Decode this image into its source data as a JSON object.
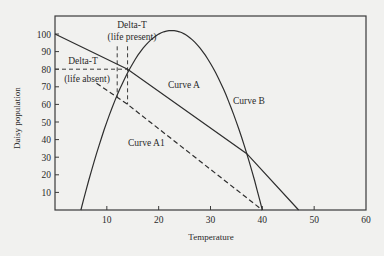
{
  "chart_data": {
    "type": "line",
    "title": "",
    "xlabel": "Temperature",
    "ylabel": "Daisy population",
    "xlim": [
      0,
      60
    ],
    "ylim": [
      0,
      105
    ],
    "x_ticks": [
      10,
      20,
      30,
      40,
      50,
      60
    ],
    "y_ticks": [
      10,
      20,
      30,
      40,
      50,
      60,
      70,
      80,
      90,
      100
    ],
    "grid": false,
    "legend": "none",
    "series": [
      {
        "name": "Curve A",
        "style": "solid",
        "shape": "parabola",
        "points": [
          [
            5,
            0
          ],
          [
            10,
            45
          ],
          [
            14,
            80
          ],
          [
            18,
            96
          ],
          [
            22.5,
            102
          ],
          [
            27,
            96
          ],
          [
            32,
            74
          ],
          [
            36,
            44
          ],
          [
            40,
            0
          ]
        ]
      },
      {
        "name": "Curve B",
        "style": "solid",
        "shape": "line",
        "points": [
          [
            0,
            100
          ],
          [
            14,
            80
          ],
          [
            37,
            32
          ],
          [
            47,
            0
          ]
        ]
      },
      {
        "name": "Curve A1",
        "style": "dashed",
        "shape": "line",
        "points": [
          [
            8,
            72
          ],
          [
            14,
            60
          ],
          [
            40,
            0
          ]
        ]
      }
    ],
    "annotations": [
      {
        "text": "Delta-T",
        "sub": "(life present)",
        "x": 14,
        "y": 108,
        "type": "label"
      },
      {
        "text": "Delta-T",
        "sub": "(life absent)",
        "x": 4,
        "y": 84,
        "type": "label"
      },
      {
        "text": "Curve A",
        "x": 26,
        "y": 72,
        "type": "label"
      },
      {
        "text": "Curve B",
        "x": 36,
        "y": 65,
        "type": "label"
      },
      {
        "text": "Curve A1",
        "x": 22,
        "y": 46,
        "type": "label"
      },
      {
        "type": "dashed-guide",
        "from": [
          0,
          80
        ],
        "to": [
          14,
          80
        ]
      },
      {
        "type": "dashed-guide",
        "from": [
          12,
          93
        ],
        "to": [
          12,
          64
        ]
      },
      {
        "type": "dashed-guide",
        "from": [
          14,
          93
        ],
        "to": [
          14,
          60
        ]
      }
    ]
  },
  "labels": {
    "xlabel": "Temperature",
    "ylabel": "Daisy population",
    "delta_present_1": "Delta-T",
    "delta_present_2": "(life present)",
    "delta_absent_1": "Delta-T",
    "delta_absent_2": "(life absent)",
    "curve_a": "Curve A",
    "curve_b": "Curve B",
    "curve_a1": "Curve A1"
  }
}
